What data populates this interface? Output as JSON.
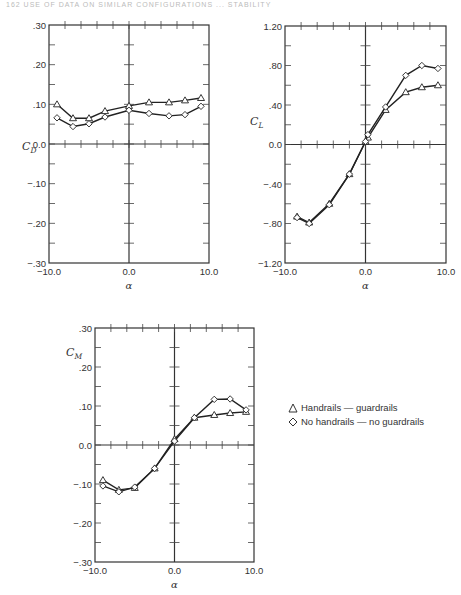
{
  "header": {
    "text": "162   USE OF DATA ON SIMILAR CONFIGURATIONS ... STABILITY"
  },
  "legend": {
    "items": [
      {
        "marker": "triangle",
        "label": "Handrails — guardrails"
      },
      {
        "marker": "diamond",
        "label": "No handrails — no guardrails"
      }
    ]
  },
  "chart_data": [
    {
      "type": "line",
      "title": "",
      "xlabel": "α",
      "ylabel": "C_D",
      "xlim": [
        -10.0,
        10.0
      ],
      "ylim": [
        -0.3,
        0.3
      ],
      "x_ticks": [
        "-10.0",
        "0.0",
        "10.0"
      ],
      "y_ticks": [
        ".30",
        ".20",
        ".10",
        "0.0",
        "-.10",
        "-.20",
        "-.30"
      ],
      "grid": false,
      "series": [
        {
          "name": "Handrails — guardrails",
          "marker": "triangle",
          "x": [
            -9,
            -7,
            -5,
            -3,
            0,
            2.5,
            5,
            7,
            9
          ],
          "y": [
            0.1,
            0.065,
            0.065,
            0.083,
            0.096,
            0.105,
            0.105,
            0.11,
            0.116
          ]
        },
        {
          "name": "No handrails — no guardrails",
          "marker": "diamond",
          "x": [
            -9,
            -7,
            -5,
            -3,
            0,
            2.5,
            5,
            7,
            9
          ],
          "y": [
            0.066,
            0.044,
            0.051,
            0.068,
            0.085,
            0.077,
            0.071,
            0.074,
            0.095
          ]
        }
      ]
    },
    {
      "type": "line",
      "title": "",
      "xlabel": "α",
      "ylabel": "C_L",
      "xlim": [
        -10.0,
        10.0
      ],
      "ylim": [
        -1.2,
        1.2
      ],
      "x_ticks": [
        "-10.0",
        "0.0",
        "10.0"
      ],
      "y_ticks": [
        "1.20",
        ".80",
        ".40",
        "0.0",
        "-.40",
        "-.80",
        "-1.20"
      ],
      "grid": false,
      "series": [
        {
          "name": "Handrails — guardrails",
          "marker": "triangle",
          "x": [
            -8.5,
            -7,
            -4.5,
            -2,
            0,
            0.3,
            2.5,
            5,
            7,
            9
          ],
          "y": [
            -0.73,
            -0.79,
            -0.6,
            -0.3,
            0.03,
            0.07,
            0.35,
            0.53,
            0.58,
            0.6
          ]
        },
        {
          "name": "No handrails — no guardrails",
          "marker": "diamond",
          "x": [
            -8.5,
            -7,
            -4.5,
            -2,
            0,
            0.3,
            2.5,
            5,
            7,
            9
          ],
          "y": [
            -0.74,
            -0.8,
            -0.61,
            -0.3,
            0.03,
            0.1,
            0.38,
            0.7,
            0.8,
            0.77
          ]
        }
      ]
    },
    {
      "type": "line",
      "title": "",
      "xlabel": "α",
      "ylabel": "C_M",
      "xlim": [
        -10.0,
        10.0
      ],
      "ylim": [
        -0.3,
        0.3
      ],
      "x_ticks": [
        "-10.0",
        "0.0",
        "10.0"
      ],
      "y_ticks": [
        ".30",
        ".20",
        ".10",
        "0.0",
        "-.10",
        "-.20",
        "-.30"
      ],
      "grid": false,
      "series": [
        {
          "name": "Handrails — guardrails",
          "marker": "triangle",
          "x": [
            -9,
            -7,
            -5,
            -2.5,
            0,
            2.5,
            5,
            7,
            9
          ],
          "y": [
            -0.09,
            -0.115,
            -0.11,
            -0.06,
            0.015,
            0.07,
            0.077,
            0.082,
            0.085
          ]
        },
        {
          "name": "No handrails — no guardrails",
          "marker": "diamond",
          "x": [
            -9,
            -7,
            -5,
            -2.5,
            0,
            2.5,
            5,
            7,
            9
          ],
          "y": [
            -0.105,
            -0.12,
            -0.108,
            -0.06,
            0.01,
            0.07,
            0.117,
            0.118,
            0.09
          ]
        }
      ]
    }
  ]
}
